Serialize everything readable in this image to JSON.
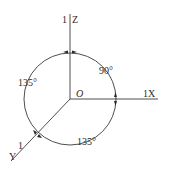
{
  "diagram": {
    "type": "axonometric-axes",
    "origin": {
      "label": "O"
    },
    "axes": [
      {
        "name": "Z",
        "label": "Z",
        "scale_label": "1",
        "direction": "up"
      },
      {
        "name": "X",
        "label": "1X",
        "direction": "right"
      },
      {
        "name": "Y",
        "label": "Y",
        "scale_label": "1",
        "direction": "down-left"
      }
    ],
    "angles": [
      {
        "between": "Z-X",
        "label": "90°"
      },
      {
        "between": "Z-Y",
        "label": "135°"
      },
      {
        "between": "X-Y",
        "label": "135°"
      }
    ],
    "colors": {
      "stroke": "#3a3a3a",
      "text": "#2a2a2a",
      "background": "#ffffff"
    }
  }
}
